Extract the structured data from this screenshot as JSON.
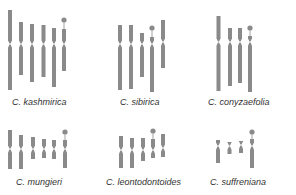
{
  "figure": {
    "type": "karyotype-idiogram",
    "chromosome_color": "#8a8a8a",
    "background": "#ffffff",
    "species": [
      {
        "name": "C. kashmirica",
        "label_pos": [
          12,
          100
        ],
        "chromosomes": [
          {
            "x": 10,
            "top": 10,
            "cent": 44,
            "bottom": 90,
            "w": 4
          },
          {
            "x": 21,
            "top": 22,
            "cent": 44,
            "bottom": 75,
            "w": 4
          },
          {
            "x": 32,
            "top": 24,
            "cent": 44,
            "bottom": 82,
            "w": 4
          },
          {
            "x": 43.5,
            "top": 25,
            "cent": 44,
            "bottom": 77,
            "w": 4
          },
          {
            "x": 54,
            "top": 28,
            "cent": 44,
            "bottom": 87,
            "w": 4
          },
          {
            "x": 64,
            "top": 29,
            "cent": 44,
            "bottom": 71,
            "w": 4,
            "satellite": 20
          }
        ]
      },
      {
        "name": "C. sibirica",
        "label_pos": [
          120,
          100
        ],
        "chromosomes": [
          {
            "x": 120,
            "top": 25,
            "cent": 44,
            "bottom": 90,
            "w": 4
          },
          {
            "x": 131,
            "top": 25,
            "cent": 44,
            "bottom": 89,
            "w": 4
          },
          {
            "x": 142,
            "top": 33,
            "cent": 44,
            "bottom": 77,
            "w": 4
          },
          {
            "x": 152,
            "top": 37,
            "cent": 44,
            "bottom": 92,
            "w": 4,
            "satellite": 28
          },
          {
            "x": 163,
            "top": 20,
            "cent": 42,
            "bottom": 68,
            "w": 4
          }
        ]
      },
      {
        "name": "C. conyzaefolia",
        "label_pos": [
          208,
          100
        ],
        "chromosomes": [
          {
            "x": 218.5,
            "top": 16,
            "cent": 42,
            "bottom": 91,
            "w": 4
          },
          {
            "x": 230,
            "top": 28,
            "cent": 42,
            "bottom": 86,
            "w": 4
          },
          {
            "x": 240,
            "top": 28,
            "cent": 42,
            "bottom": 83,
            "w": 4
          },
          {
            "x": 250,
            "top": 36,
            "cent": 42,
            "bottom": 92,
            "w": 4,
            "satellite": 28
          }
        ]
      },
      {
        "name": "C. mungieri",
        "label_pos": [
          16,
          180
        ],
        "chromosomes": [
          {
            "x": 10,
            "top": 130,
            "cent": 149,
            "bottom": 169,
            "w": 4
          },
          {
            "x": 21,
            "top": 135,
            "cent": 149,
            "bottom": 169,
            "w": 4
          },
          {
            "x": 33,
            "top": 137,
            "cent": 149,
            "bottom": 159,
            "w": 4
          },
          {
            "x": 44,
            "top": 139,
            "cent": 149,
            "bottom": 158,
            "w": 4
          },
          {
            "x": 54,
            "top": 140,
            "cent": 149,
            "bottom": 159,
            "w": 4
          },
          {
            "x": 65,
            "top": 140,
            "cent": 149,
            "bottom": 168,
            "w": 4,
            "satellite": 132
          }
        ]
      },
      {
        "name": "C. leontodontoides",
        "label_pos": [
          106,
          180
        ],
        "chromosomes": [
          {
            "x": 121,
            "top": 136,
            "cent": 150,
            "bottom": 168,
            "w": 4
          },
          {
            "x": 132,
            "top": 138,
            "cent": 150,
            "bottom": 168,
            "w": 4
          },
          {
            "x": 143,
            "top": 138,
            "cent": 150,
            "bottom": 161,
            "w": 4
          },
          {
            "x": 153,
            "top": 139,
            "cent": 150,
            "bottom": 158,
            "w": 4,
            "satellite": 131
          },
          {
            "x": 163,
            "top": 134,
            "cent": 148,
            "bottom": 157,
            "w": 4
          }
        ]
      },
      {
        "name": "C. suffreniana",
        "label_pos": [
          210,
          180
        ],
        "chromosomes": [
          {
            "x": 218,
            "top": 140,
            "cent": 146,
            "bottom": 163,
            "w": 4
          },
          {
            "x": 229.5,
            "top": 142,
            "cent": 146,
            "bottom": 154,
            "w": 4
          },
          {
            "x": 241,
            "top": 141,
            "cent": 145,
            "bottom": 153,
            "w": 4
          },
          {
            "x": 252,
            "top": 139,
            "cent": 146,
            "bottom": 168,
            "w": 4,
            "satellite": 132
          }
        ]
      }
    ]
  }
}
